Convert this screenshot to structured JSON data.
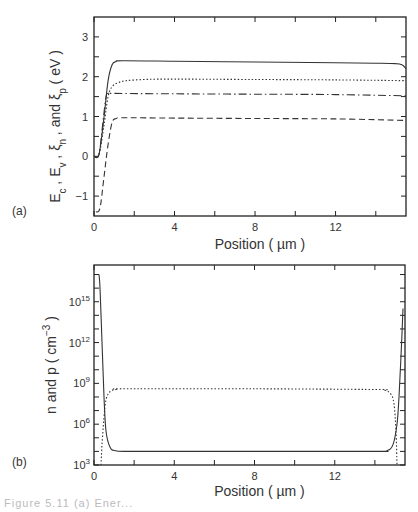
{
  "chart_data": [
    {
      "panel": "(a)",
      "type": "line",
      "title": "",
      "xlabel": "Position ( µm )",
      "ylabel": "Ec , Ev , ξn , and ξp ( eV )",
      "xlim": [
        0,
        15.5
      ],
      "ylim": [
        -1.5,
        3.5
      ],
      "xticks": [
        0,
        4,
        8,
        12
      ],
      "xminor": [
        2,
        6,
        10,
        14
      ],
      "yticks": [
        -1,
        0,
        1,
        2,
        3
      ],
      "yminor": [
        -0.5,
        0.5,
        1.5,
        2.5
      ],
      "grid": false,
      "legend": null,
      "series": [
        {
          "name": "Ec",
          "style": "solid",
          "x": [
            0,
            0.25,
            0.5,
            0.7,
            0.9,
            1.1,
            1.4,
            4,
            8,
            12,
            14,
            15.0,
            15.3,
            15.5
          ],
          "y": [
            0.0,
            0.05,
            1.0,
            1.9,
            2.3,
            2.38,
            2.4,
            2.39,
            2.37,
            2.35,
            2.34,
            2.33,
            2.3,
            2.2
          ]
        },
        {
          "name": "ξn",
          "style": "dotted",
          "x": [
            0,
            0.25,
            0.5,
            0.7,
            0.9,
            1.2,
            1.6,
            2.5,
            4,
            8,
            12,
            15.5
          ],
          "y": [
            0.0,
            0.05,
            0.8,
            1.5,
            1.75,
            1.85,
            1.9,
            1.93,
            1.94,
            1.93,
            1.92,
            1.9
          ]
        },
        {
          "name": "ξp",
          "style": "dashdot",
          "x": [
            0,
            0.25,
            0.45,
            0.6,
            0.7,
            1.0,
            4,
            8,
            12,
            15.5
          ],
          "y": [
            0.0,
            0.05,
            0.9,
            1.5,
            1.58,
            1.58,
            1.57,
            1.56,
            1.55,
            1.52
          ]
        },
        {
          "name": "Ev",
          "style": "dashed",
          "x": [
            0.1,
            0.3,
            0.5,
            0.7,
            0.9,
            1.1,
            1.5,
            4,
            8,
            12,
            15.5
          ],
          "y": [
            -1.4,
            -1.3,
            -0.5,
            0.3,
            0.85,
            0.95,
            0.97,
            0.96,
            0.95,
            0.94,
            0.9
          ]
        }
      ]
    },
    {
      "panel": "(b)",
      "type": "line",
      "title": "",
      "xlabel": "Position ( µm )",
      "ylabel": "n and p ( cm−3 )",
      "yscale": "log",
      "xlim": [
        0,
        15.5
      ],
      "ylim_log10": [
        3,
        17.7
      ],
      "xticks": [
        0,
        4,
        8,
        12
      ],
      "xminor": [
        2,
        6,
        10,
        14
      ],
      "yticks_log10": [
        3,
        6,
        9,
        12,
        15
      ],
      "ytick_labels": [
        "10³",
        "10⁶",
        "10⁹",
        "10¹²",
        "10¹⁵"
      ],
      "grid": false,
      "legend": null,
      "series": [
        {
          "name": "n",
          "style": "solid",
          "x": [
            0.25,
            0.3,
            0.4,
            0.5,
            0.6,
            0.8,
            1.1,
            2,
            8,
            14,
            14.6,
            14.9,
            15.1,
            15.2,
            15.3,
            15.4
          ],
          "log10y": [
            17.0,
            16.0,
            12.0,
            8.0,
            5.5,
            4.3,
            4.05,
            4.0,
            4.0,
            4.0,
            4.05,
            4.5,
            6.0,
            8.0,
            11.0,
            14.5
          ]
        },
        {
          "name": "p",
          "style": "dotted",
          "x": [
            0.35,
            0.4,
            0.5,
            0.6,
            0.8,
            1.1,
            1.6,
            8,
            14,
            14.5,
            14.8,
            14.95,
            15.05,
            15.1
          ],
          "log10y": [
            3.0,
            4.5,
            6.5,
            7.8,
            8.4,
            8.55,
            8.6,
            8.6,
            8.55,
            8.5,
            8.2,
            7.5,
            5.5,
            3.0
          ]
        }
      ]
    }
  ],
  "panels": {
    "a": {
      "label": "(a)",
      "xlabel": "Position ( µm )",
      "ylabel_parts": [
        "E",
        "c",
        " , E",
        "v",
        " , ξ",
        "n",
        " , and ξ",
        "p",
        " ( eV )"
      ],
      "xtick_labels": [
        "0",
        "4",
        "8",
        "12"
      ],
      "ytick_labels": [
        "−1",
        "0",
        "1",
        "2",
        "3"
      ]
    },
    "b": {
      "label": "(b)",
      "xlabel": "Position ( µm )",
      "ylabel_main": "n and p ( cm",
      "ylabel_sup": "−3",
      "ylabel_end": " )",
      "xtick_labels": [
        "0",
        "4",
        "8",
        "12"
      ],
      "ytick_base": "10",
      "ytick_exps": [
        "3",
        "6",
        "9",
        "12",
        "15"
      ]
    }
  },
  "caption": {
    "text": "Figure 5.11  (a) Ener..."
  },
  "colors": {
    "line": "#333333",
    "frame": "#222222",
    "text": "#333333"
  }
}
